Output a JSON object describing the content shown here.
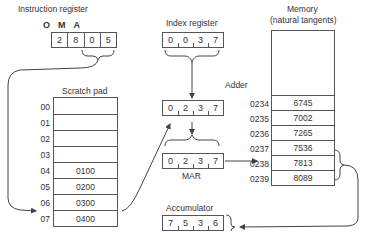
{
  "instruction_register": {
    "title": "Instruction register",
    "fields": [
      "O",
      "M",
      "A"
    ],
    "digits": [
      "2",
      "8",
      "0",
      "5"
    ]
  },
  "index_register": {
    "title": "Index register",
    "digits": [
      "0",
      "0",
      "3",
      "7"
    ]
  },
  "adder": {
    "title": "Adder",
    "digits": [
      "0",
      "2",
      "3",
      "7"
    ]
  },
  "mar": {
    "title": "MAR",
    "digits": [
      "0",
      "2",
      "3",
      "7"
    ]
  },
  "accumulator": {
    "title": "Accumulator",
    "digits": [
      "7",
      "5",
      "3",
      "6"
    ]
  },
  "scratch_pad": {
    "title": "Scratch pad",
    "rows": [
      {
        "addr": "00",
        "value": ""
      },
      {
        "addr": "01",
        "value": ""
      },
      {
        "addr": "02",
        "value": ""
      },
      {
        "addr": "03",
        "value": ""
      },
      {
        "addr": "04",
        "value": "0100"
      },
      {
        "addr": "05",
        "value": "0200"
      },
      {
        "addr": "06",
        "value": "0300"
      },
      {
        "addr": "07",
        "value": "0400"
      }
    ]
  },
  "memory": {
    "title_line1": "Memory",
    "title_line2": "(natural tangents)",
    "rows": [
      {
        "addr": "0234",
        "value": "6745"
      },
      {
        "addr": "0235",
        "value": "7002"
      },
      {
        "addr": "0236",
        "value": "7265"
      },
      {
        "addr": "0237",
        "value": "7536"
      },
      {
        "addr": "0238",
        "value": "7813"
      },
      {
        "addr": "0239",
        "value": "8089"
      }
    ]
  }
}
